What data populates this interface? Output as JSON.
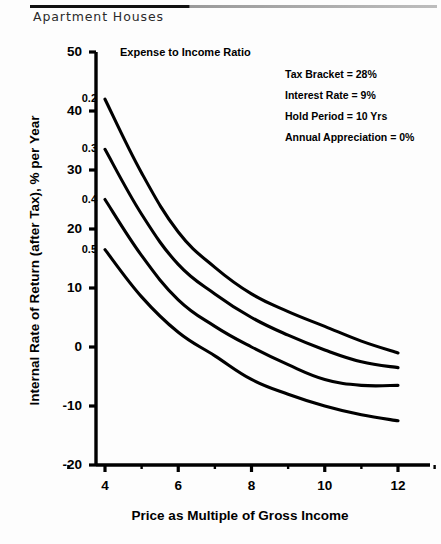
{
  "header": {
    "title": "Apartment Houses"
  },
  "chart_data": {
    "type": "line",
    "title": "",
    "xlabel": "Price as Multiple of Gross Income",
    "ylabel": "Internal Rate of Return (after Tax), % per Year",
    "legend_title": "Expense to Income Ratio",
    "legend_position": "inline-curve-labels",
    "grid": false,
    "xlim": [
      3,
      13
    ],
    "ylim": [
      -20,
      50
    ],
    "xticks": [
      4,
      6,
      8,
      10,
      12
    ],
    "xtick_labels": [
      "4",
      "6",
      "8",
      "10",
      "12"
    ],
    "xminor_ticks": [
      3,
      5,
      7,
      9,
      11,
      13
    ],
    "yticks": [
      -20,
      -10,
      0,
      10,
      20,
      30,
      40,
      50
    ],
    "ytick_labels": [
      "-20",
      "-10",
      "0",
      "10",
      "20",
      "30",
      "40",
      "50"
    ],
    "x": [
      4,
      5,
      6,
      7,
      8,
      9,
      10,
      11,
      12
    ],
    "series": [
      {
        "name": "0.2",
        "label": "0.2",
        "values": [
          42.0,
          29.5,
          19.5,
          13.5,
          9.0,
          6.0,
          3.5,
          1.0,
          -1.0
        ],
        "color": "#000000"
      },
      {
        "name": "0.3",
        "label": "0.3",
        "values": [
          33.5,
          22.5,
          14.0,
          9.0,
          5.0,
          2.0,
          -0.5,
          -2.5,
          -3.5
        ],
        "color": "#000000"
      },
      {
        "name": "0.4",
        "label": "0.4",
        "values": [
          25.0,
          15.5,
          8.0,
          3.5,
          0.0,
          -3.0,
          -5.5,
          -6.5,
          -6.5
        ],
        "color": "#000000"
      },
      {
        "name": "0.5",
        "label": "0.5",
        "values": [
          16.5,
          8.5,
          2.5,
          -1.5,
          -5.5,
          -8.0,
          -10.0,
          -11.5,
          -12.5
        ],
        "color": "#000000"
      }
    ],
    "annotations": [
      "Tax Bracket = 28%",
      "Interest Rate = 9%",
      "Hold Period = 10 Yrs",
      "Annual Appreciation = 0%"
    ]
  }
}
